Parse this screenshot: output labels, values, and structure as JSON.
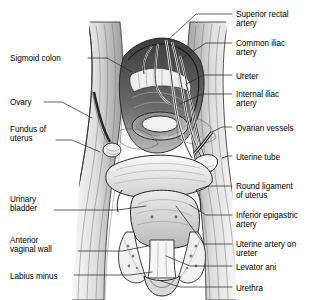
{
  "figure": {
    "style": "pen-and-ink anatomical line drawing, grayscale",
    "colors": {
      "background": "#ffffff",
      "ink": "#1a1a1a",
      "leader_line": "#2b2b2b",
      "mid_gray": "#9a9a9a",
      "light_gray": "#d8d8d8",
      "dark_gray": "#4a4a4a",
      "shadow": "#2e2e2e"
    }
  },
  "labels_left": [
    {
      "id": "sigmoid-colon",
      "text": "Sigmoid colon",
      "x": 10,
      "y": 54,
      "lead": [
        [
          88,
          58
        ],
        [
          107,
          58
        ],
        [
          132,
          72
        ]
      ]
    },
    {
      "id": "ovary",
      "text": "Ovary",
      "x": 10,
      "y": 98,
      "lead": [
        [
          44,
          102
        ],
        [
          62,
          102
        ],
        [
          92,
          118
        ]
      ]
    },
    {
      "id": "fundus-of-uterus",
      "text": "Fundus of\nuterus",
      "x": 10,
      "y": 125,
      "lead": [
        [
          56,
          140
        ],
        [
          72,
          140
        ],
        [
          100,
          152
        ]
      ]
    },
    {
      "id": "urinary-bladder",
      "text": "Urinary\nbladder",
      "x": 10,
      "y": 195,
      "lead": [
        [
          54,
          210
        ],
        [
          118,
          210
        ],
        [
          146,
          206
        ]
      ]
    },
    {
      "id": "anterior-vaginal-wall",
      "text": "Anterior\nvaginal wall",
      "x": 10,
      "y": 236,
      "lead": [
        [
          78,
          251
        ],
        [
          122,
          251
        ],
        [
          148,
          246
        ]
      ]
    },
    {
      "id": "labius-minus",
      "text": "Labius minus",
      "x": 10,
      "y": 272,
      "lead": [
        [
          74,
          275
        ],
        [
          130,
          275
        ],
        [
          152,
          272
        ]
      ]
    }
  ],
  "labels_right": [
    {
      "id": "superior-rectal-artery",
      "text": "Superior rectal\nartery",
      "x": 236,
      "y": 10,
      "lead": [
        [
          232,
          14
        ],
        [
          196,
          14
        ],
        [
          168,
          40
        ]
      ]
    },
    {
      "id": "common-iliac-artery",
      "text": "Common iliac\nartery",
      "x": 236,
      "y": 39,
      "lead": [
        [
          232,
          43
        ],
        [
          206,
          43
        ],
        [
          182,
          58
        ]
      ]
    },
    {
      "id": "ureter",
      "text": "Ureter",
      "x": 236,
      "y": 72,
      "lead": [
        [
          232,
          75
        ],
        [
          204,
          75
        ],
        [
          186,
          84
        ]
      ]
    },
    {
      "id": "internal-iliac-artery",
      "text": "Internal iliac\nartery",
      "x": 236,
      "y": 90,
      "lead": [
        [
          232,
          94
        ],
        [
          202,
          94
        ],
        [
          180,
          104
        ]
      ]
    },
    {
      "id": "ovarian-vessels",
      "text": "Ovarian vessels",
      "x": 236,
      "y": 124,
      "lead": [
        [
          232,
          127
        ],
        [
          222,
          127
        ],
        [
          212,
          132
        ]
      ]
    },
    {
      "id": "uterine-tube",
      "text": "Uterine tube",
      "x": 236,
      "y": 153,
      "lead": [
        [
          232,
          156
        ],
        [
          228,
          156
        ],
        [
          222,
          158
        ]
      ]
    },
    {
      "id": "round-ligament-of-uterus",
      "text": "Round ligament\nof uterus",
      "x": 236,
      "y": 182,
      "lead": [
        [
          232,
          186
        ],
        [
          208,
          186
        ],
        [
          196,
          190
        ]
      ]
    },
    {
      "id": "inferior-epigastric-artery",
      "text": "Inferior epigastric\nartery",
      "x": 236,
      "y": 211,
      "lead": [
        [
          232,
          215
        ],
        [
          206,
          215
        ],
        [
          190,
          205
        ]
      ]
    },
    {
      "id": "uterine-artery-on-ureter",
      "text": "Uterine artery on\nureter",
      "x": 236,
      "y": 240,
      "lead": [
        [
          232,
          244
        ],
        [
          204,
          244
        ],
        [
          176,
          206
        ]
      ]
    },
    {
      "id": "levator-ani",
      "text": "Levator ani",
      "x": 236,
      "y": 263,
      "lead": [
        [
          232,
          266
        ],
        [
          190,
          266
        ],
        [
          166,
          256
        ]
      ]
    },
    {
      "id": "urethra",
      "text": "Urethra",
      "x": 236,
      "y": 284,
      "lead": [
        [
          232,
          287
        ],
        [
          180,
          287
        ],
        [
          158,
          280
        ]
      ]
    }
  ]
}
